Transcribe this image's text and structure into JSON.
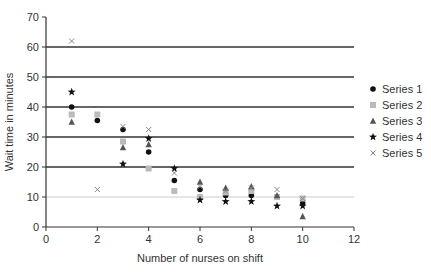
{
  "chart_data": {
    "type": "scatter",
    "title": "",
    "xlabel": "Number of nurses on shift",
    "ylabel": "Wait time in minutes",
    "xlim": [
      0,
      12
    ],
    "ylim": [
      0,
      70
    ],
    "xticks": [
      0,
      2,
      4,
      6,
      8,
      10,
      12
    ],
    "yticks": [
      0,
      10,
      20,
      30,
      40,
      50,
      60,
      70
    ],
    "grid": "horizontal",
    "legend_position": "right",
    "series": [
      {
        "name": "Series 1",
        "marker": "circle",
        "color": "#111111",
        "points": [
          [
            1,
            40
          ],
          [
            2,
            35.5
          ],
          [
            3,
            32.5
          ],
          [
            4,
            25
          ],
          [
            5,
            15.5
          ],
          [
            6,
            12.5
          ],
          [
            7,
            10.5
          ],
          [
            8,
            10.5
          ],
          [
            9,
            10
          ],
          [
            10,
            8
          ]
        ]
      },
      {
        "name": "Series 2",
        "marker": "square",
        "color": "#bbbbbb",
        "points": [
          [
            1,
            37.5
          ],
          [
            2,
            37.5
          ],
          [
            3,
            28.5
          ],
          [
            4,
            19.5
          ],
          [
            5,
            12
          ],
          [
            6,
            10
          ],
          [
            7,
            11.5
          ],
          [
            8,
            12
          ],
          [
            9,
            10
          ],
          [
            10,
            9.5
          ]
        ]
      },
      {
        "name": "Series 3",
        "marker": "triangle",
        "color": "#555555",
        "points": [
          [
            1,
            35
          ],
          [
            3,
            26.5
          ],
          [
            4,
            27.5
          ],
          [
            6,
            15
          ],
          [
            7,
            13
          ],
          [
            8,
            13.5
          ],
          [
            9,
            10.5
          ],
          [
            10,
            3.5
          ]
        ]
      },
      {
        "name": "Series 4",
        "marker": "star",
        "color": "#111111",
        "points": [
          [
            1,
            45
          ],
          [
            3,
            21
          ],
          [
            4,
            29.5
          ],
          [
            5,
            19.5
          ],
          [
            6,
            9
          ],
          [
            7,
            8.5
          ],
          [
            8,
            8.5
          ],
          [
            9,
            7
          ],
          [
            10,
            7
          ]
        ]
      },
      {
        "name": "Series 5",
        "marker": "x",
        "color": "#888888",
        "points": [
          [
            1,
            62
          ],
          [
            2,
            12.5
          ],
          [
            3,
            33.5
          ],
          [
            4,
            32.5
          ],
          [
            5,
            18
          ],
          [
            6,
            13.5
          ],
          [
            7,
            12
          ],
          [
            8,
            13
          ],
          [
            9,
            12.5
          ],
          [
            10,
            9.5
          ]
        ]
      }
    ]
  }
}
